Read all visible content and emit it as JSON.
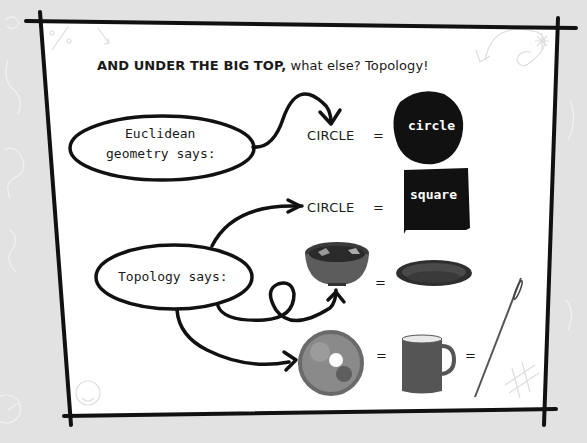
{
  "heading": {
    "bold": "AND UNDER THE BIG TOP,",
    "rest": " what else? Topology!"
  },
  "euclidean": {
    "bubble_line1": "Euclidean",
    "bubble_line2": "geometry says:",
    "lhs": "CIRCLE",
    "equals": "=",
    "rhs_shape": "circle",
    "rhs_label": "circle"
  },
  "topology": {
    "bubble": "Topology says:",
    "row1": {
      "lhs": "CIRCLE",
      "equals": "=",
      "rhs_shape": "square",
      "rhs_label": "square"
    },
    "row2": {
      "lhs": "bowl-image",
      "equals": "=",
      "rhs": "plate-image"
    },
    "row3": {
      "lhs": "donut-image",
      "equals1": "=",
      "mid": "mug-image",
      "equals2": "=",
      "rhs": "needle-image"
    }
  },
  "colors": {
    "background": "#e2e2e2",
    "panel": "#ffffff",
    "ink": "#111111",
    "doodle": "#c8c8c8"
  }
}
